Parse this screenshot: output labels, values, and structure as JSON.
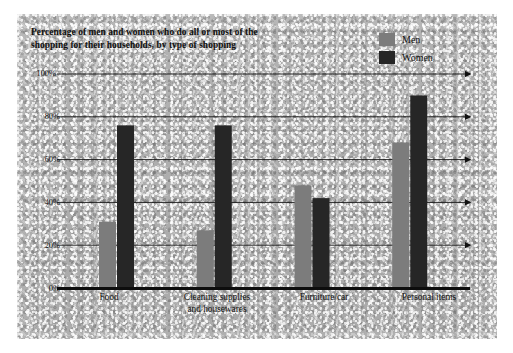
{
  "figure": {
    "title": "Percentage of men and women who do all or most of the shopping for their households, by type of shopping",
    "title_line1": "Percentage of men and women who do all or most of the",
    "title_line2": "shopping for their households, by type of shopping"
  },
  "legend": {
    "position": "top-right",
    "entries": [
      {
        "label": "Men",
        "color": "#7c7c7c"
      },
      {
        "label": "Women",
        "color": "#262626"
      }
    ]
  },
  "axis": {
    "y_ticks": [
      "0%",
      "20%",
      "40%",
      "60%",
      "80%",
      "100%"
    ],
    "x_categories": [
      {
        "line1": "Food",
        "line2": ""
      },
      {
        "line1": "Cleaning supplies",
        "line2": "and housewares"
      },
      {
        "line1": "Furniture/car",
        "line2": ""
      },
      {
        "line1": "Personal items",
        "line2": ""
      }
    ]
  },
  "chart_data": {
    "type": "bar",
    "title": "Percentage of men and women who do all or most of the shopping for their households, by type of shopping",
    "xlabel": "",
    "ylabel": "",
    "ylim": [
      0,
      100
    ],
    "yticks": [
      0,
      20,
      40,
      60,
      80,
      100
    ],
    "ytick_labels": [
      "0%",
      "20%",
      "40%",
      "60%",
      "80%",
      "100%"
    ],
    "grid": true,
    "legend_position": "top-right",
    "categories": [
      "Food",
      "Cleaning supplies and housewares",
      "Furniture/car",
      "Personal items"
    ],
    "series": [
      {
        "name": "Men",
        "color": "#7c7c7c",
        "values": [
          31,
          27,
          48,
          68
        ]
      },
      {
        "name": "Women",
        "color": "#262626",
        "values": [
          76,
          76,
          42,
          90
        ]
      }
    ]
  }
}
